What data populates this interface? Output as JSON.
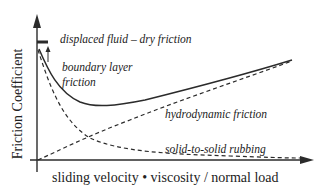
{
  "diagram": {
    "type": "stribeck-curve",
    "axes": {
      "ylabel": "Friction Coefficient",
      "xlabel": "sliding velocity • viscosity / normal load"
    },
    "annotations": {
      "displaced": "displaced fluid – dry friction",
      "boundary_line1": "boundary layer",
      "boundary_line2": "friction",
      "hydrodynamic": "hydrodynamic friction",
      "solid": "solid-to-solid rubbing"
    },
    "curves": [
      {
        "name": "total friction",
        "style": "solid"
      },
      {
        "name": "boundary layer friction (decaying)",
        "style": "dashed"
      },
      {
        "name": "hydrodynamic friction (rising)",
        "style": "dashed"
      }
    ],
    "colors": {
      "line": "#2b2b2b",
      "text": "#222222",
      "background": "#ffffff"
    }
  }
}
